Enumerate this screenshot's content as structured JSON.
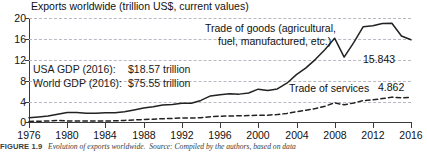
{
  "chart_data": {
    "type": "line",
    "title": "Exports worldwide (trillion US$, current values)",
    "xlabel": "",
    "ylabel": "",
    "xlim": [
      1976,
      2016
    ],
    "ylim": [
      0,
      20
    ],
    "yticks": [
      0,
      4,
      8,
      12,
      16,
      20
    ],
    "xticks": [
      1976,
      1980,
      1984,
      1988,
      1992,
      1996,
      2000,
      2004,
      2008,
      2012,
      2016
    ],
    "grid": "horizontal-dashed",
    "legend": "inline-annotations",
    "x": [
      1976,
      1977,
      1978,
      1979,
      1980,
      1981,
      1982,
      1983,
      1984,
      1985,
      1986,
      1987,
      1988,
      1989,
      1990,
      1991,
      1992,
      1993,
      1994,
      1995,
      1996,
      1997,
      1998,
      1999,
      2000,
      2001,
      2002,
      2003,
      2004,
      2005,
      2006,
      2007,
      2008,
      2009,
      2010,
      2011,
      2012,
      2013,
      2014,
      2015,
      2016
    ],
    "series": [
      {
        "name": "Trade of goods (agricultural, fuel, manufactured, etc.)",
        "style": "solid",
        "color": "#222222",
        "end_value": 15.843,
        "values": [
          0.99,
          1.15,
          1.35,
          1.68,
          2.0,
          1.99,
          1.86,
          1.85,
          1.95,
          1.95,
          2.13,
          2.48,
          2.87,
          3.1,
          3.45,
          3.52,
          3.78,
          3.77,
          4.3,
          5.16,
          5.4,
          5.59,
          5.5,
          5.71,
          6.45,
          6.19,
          6.49,
          7.58,
          9.22,
          10.49,
          12.13,
          14.02,
          16.15,
          12.56,
          15.3,
          18.35,
          18.51,
          18.95,
          19.01,
          16.56,
          15.843
        ]
      },
      {
        "name": "Trade of services",
        "style": "dashed",
        "color": "#222222",
        "end_value": 4.862,
        "values": [
          0.3,
          0.33,
          0.39,
          0.47,
          0.4,
          0.39,
          0.37,
          0.37,
          0.38,
          0.41,
          0.49,
          0.58,
          0.66,
          0.72,
          0.82,
          0.86,
          0.95,
          0.94,
          1.02,
          1.2,
          1.29,
          1.34,
          1.37,
          1.42,
          1.49,
          1.5,
          1.61,
          1.83,
          2.15,
          2.43,
          2.75,
          3.2,
          3.85,
          3.46,
          3.81,
          4.28,
          4.4,
          4.65,
          4.93,
          4.79,
          4.862
        ]
      }
    ],
    "annotations": [
      {
        "id": "goods-label",
        "line1": "Trade of goods (agricultural,",
        "line2": "fuel, manufactured, etc.)"
      },
      {
        "id": "services-label",
        "text": "Trade of services"
      },
      {
        "id": "goods-value",
        "text": "15.843"
      },
      {
        "id": "services-value",
        "text": "4.862"
      }
    ],
    "notes": [
      {
        "label": "USA GDP (2016):",
        "value": "$18.57 trillion"
      },
      {
        "label": "World GDP (2016):",
        "value": "$75.55 trillion"
      }
    ]
  },
  "figure": {
    "caption_number": "FIGURE 1.9",
    "caption_title": "Evolution of exports worldwide.",
    "caption_source": "Source: Compiled by the authors, based on data"
  }
}
